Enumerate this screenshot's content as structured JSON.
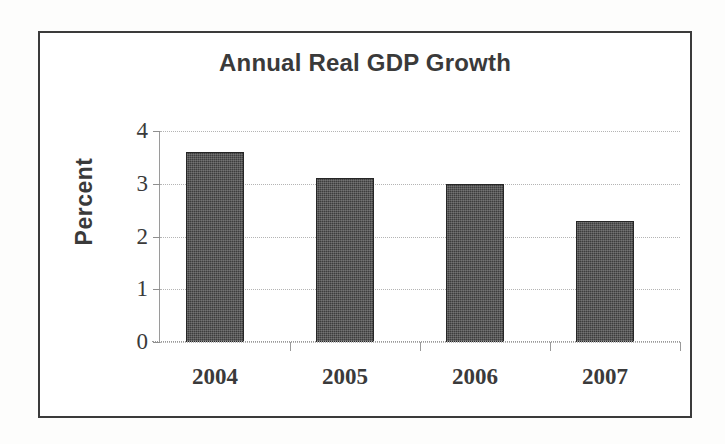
{
  "chart_data": {
    "type": "bar",
    "title": "Annual Real GDP Growth",
    "xlabel": "",
    "ylabel": "Percent",
    "categories": [
      "2004",
      "2005",
      "2006",
      "2007"
    ],
    "values": [
      3.6,
      3.1,
      3.0,
      2.3
    ],
    "ylim": [
      0,
      4
    ],
    "ytick_labels": [
      "4",
      "3",
      "2",
      "1",
      "0"
    ],
    "ytick_values": [
      4,
      3,
      2,
      1,
      0
    ],
    "grid": true,
    "legend": "none",
    "series": [
      {
        "name": "Annual Real GDP Growth",
        "values": [
          3.6,
          3.1,
          3.0,
          2.3
        ]
      }
    ]
  },
  "chart": {
    "title": "Annual Real GDP Growth",
    "y_axis_title": "Percent",
    "bar_color": "#3d3d3d",
    "grid_color": "#b4b4b4",
    "frame_color": "#3b3b3b",
    "text_color": "#3a3a3a"
  }
}
